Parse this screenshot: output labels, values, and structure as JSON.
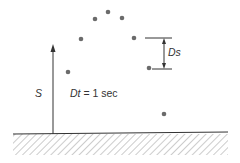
{
  "diagram": {
    "labels": {
      "height": "S",
      "dt_var": "Dt",
      "dt_rest": " = 1 sec",
      "ds": "Ds"
    },
    "points": [
      {
        "x": 68,
        "y": 72
      },
      {
        "x": 81,
        "y": 39
      },
      {
        "x": 95,
        "y": 19
      },
      {
        "x": 108,
        "y": 12
      },
      {
        "x": 122,
        "y": 18
      },
      {
        "x": 134,
        "y": 38
      },
      {
        "x": 149,
        "y": 68
      },
      {
        "x": 164,
        "y": 114
      }
    ],
    "colors": {
      "dot": "#6b6b6b",
      "line": "#333333",
      "hatch": "#999999"
    }
  }
}
